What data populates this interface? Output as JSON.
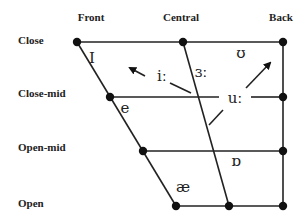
{
  "diagram": {
    "columns": [
      {
        "label": "Front",
        "x": 91,
        "y": 21
      },
      {
        "label": "Central",
        "x": 181,
        "y": 21
      },
      {
        "label": "Back",
        "x": 281,
        "y": 21
      }
    ],
    "rows": [
      {
        "label": "Close",
        "x": 18,
        "y": 44
      },
      {
        "label": "Close-mid",
        "x": 18,
        "y": 97
      },
      {
        "label": "Open-mid",
        "x": 18,
        "y": 151
      },
      {
        "label": "Open",
        "x": 18,
        "y": 207
      }
    ],
    "symbols": [
      {
        "id": "I",
        "text": "I",
        "x": 92,
        "y": 63
      },
      {
        "id": "i-long",
        "text": "iː",
        "x": 164,
        "y": 81
      },
      {
        "id": "e",
        "text": "e",
        "x": 125,
        "y": 113
      },
      {
        "id": "schwa-long",
        "text": "ɜː",
        "x": 199,
        "y": 77
      },
      {
        "id": "u-long",
        "text": "uː",
        "x": 210,
        "y": 103
      },
      {
        "id": "upsilon",
        "text": "ʊ",
        "x": 241,
        "y": 56
      },
      {
        "id": "turned-a",
        "text": "ɒ",
        "x": 232,
        "y": 168
      },
      {
        "id": "ae",
        "text": "æ",
        "x": 180,
        "y": 192
      }
    ],
    "colors": {
      "line": "#222222",
      "dot": "#111111",
      "text": "#222222"
    }
  }
}
